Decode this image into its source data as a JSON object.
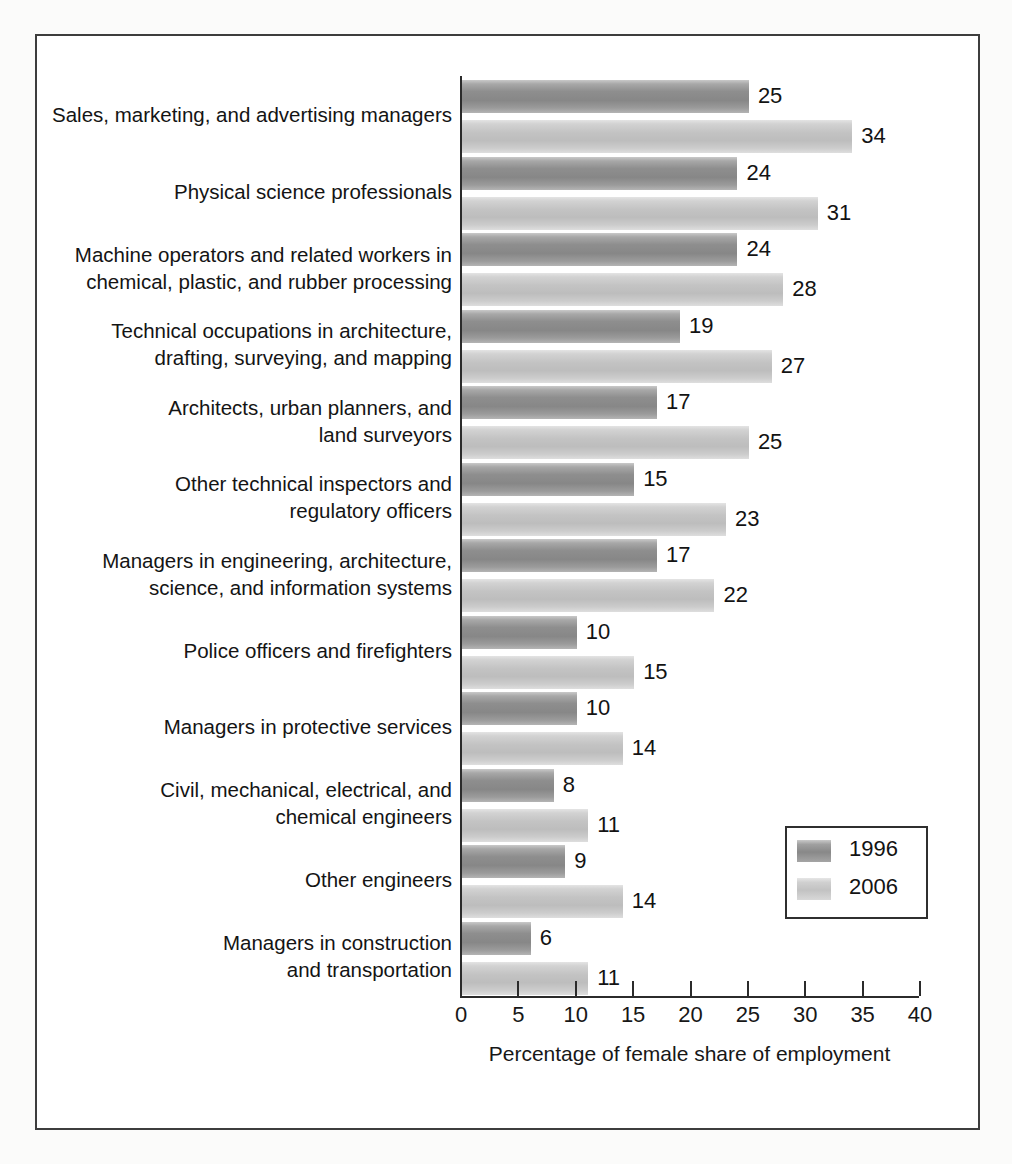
{
  "figure": {
    "legend": {
      "entries": [
        {
          "label": "1996",
          "color": "#8e8e8e"
        },
        {
          "label": "2006",
          "color": "#c3c3c3"
        }
      ]
    }
  },
  "chart_data": {
    "type": "bar",
    "orientation": "horizontal",
    "title": "",
    "xlabel": "Percentage of female share of employment",
    "ylabel": "",
    "xlim": [
      0,
      40
    ],
    "xticks": [
      0,
      5,
      10,
      15,
      20,
      25,
      30,
      35,
      40
    ],
    "xtick_labels": [
      "0",
      "5",
      "10",
      "15",
      "20",
      "25",
      "30",
      "35",
      "40"
    ],
    "grid": false,
    "legend_position": "bottom-right",
    "categories": [
      "Sales, marketing, and advertising managers",
      "Physical science professionals",
      "Machine operators and related workers in chemical, plastic, and rubber processing",
      "Technical occupations in architecture, drafting, surveying, and mapping",
      "Architects, urban planners, and land surveyors",
      "Other technical inspectors and regulatory officers",
      "Managers in engineering, architecture, science, and information systems",
      "Police officers and firefighters",
      "Managers in protective services",
      "Civil, mechanical, electrical, and chemical engineers",
      "Other engineers",
      "Managers in construction and transportation"
    ],
    "category_lines": [
      [
        "Sales, marketing, and advertising managers"
      ],
      [
        "Physical science professionals"
      ],
      [
        "Machine operators and related workers in",
        "chemical, plastic, and rubber processing"
      ],
      [
        "Technical occupations in architecture,",
        "drafting, surveying, and mapping"
      ],
      [
        "Architects, urban planners, and",
        "land surveyors"
      ],
      [
        "Other technical inspectors and",
        "regulatory officers"
      ],
      [
        "Managers in engineering, architecture,",
        "science, and information systems"
      ],
      [
        "Police officers and firefighters"
      ],
      [
        "Managers in protective services"
      ],
      [
        "Civil, mechanical, electrical, and",
        "chemical engineers"
      ],
      [
        "Other engineers"
      ],
      [
        "Managers in construction",
        "and transportation"
      ]
    ],
    "series": [
      {
        "name": "1996",
        "color": "#8e8e8e",
        "values": [
          25,
          24,
          24,
          19,
          17,
          15,
          17,
          10,
          10,
          8,
          9,
          6
        ]
      },
      {
        "name": "2006",
        "color": "#c3c3c3",
        "values": [
          34,
          31,
          28,
          27,
          25,
          23,
          22,
          15,
          14,
          11,
          14,
          11
        ]
      }
    ]
  }
}
